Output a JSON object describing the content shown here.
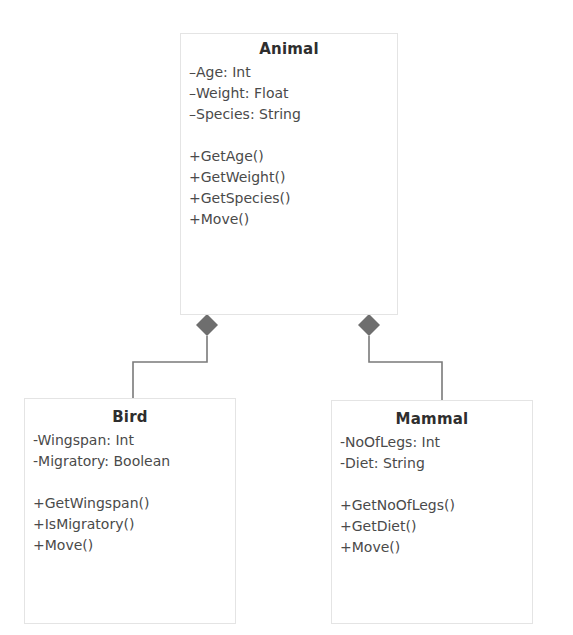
{
  "diagram": {
    "type": "UML class diagram",
    "relationship": "composition",
    "classes": {
      "animal": {
        "name": "Animal",
        "attributes": [
          "–Age: Int",
          "–Weight: Float",
          "–Species: String"
        ],
        "operations": [
          "+GetAge()",
          "+GetWeight()",
          "+GetSpecies()",
          "+Move()"
        ]
      },
      "bird": {
        "name": "Bird",
        "attributes": [
          "-Wingspan: Int",
          "-Migratory: Boolean"
        ],
        "operations": [
          "+GetWingspan()",
          "+IsMigratory()",
          "+Move()"
        ]
      },
      "mammal": {
        "name": "Mammal",
        "attributes": [
          "-NoOfLegs: Int",
          "-Diet: String"
        ],
        "operations": [
          "+GetNoOfLegs()",
          "+GetDiet()",
          "+Move()"
        ]
      }
    },
    "connectors": [
      {
        "from": "Animal",
        "to": "Bird",
        "end": "filled-diamond"
      },
      {
        "from": "Animal",
        "to": "Mammal",
        "end": "filled-diamond"
      }
    ],
    "colors": {
      "line": "#7a7a7a",
      "diamond": "#6e6e6e",
      "box_border": "#e4e4e4"
    }
  }
}
